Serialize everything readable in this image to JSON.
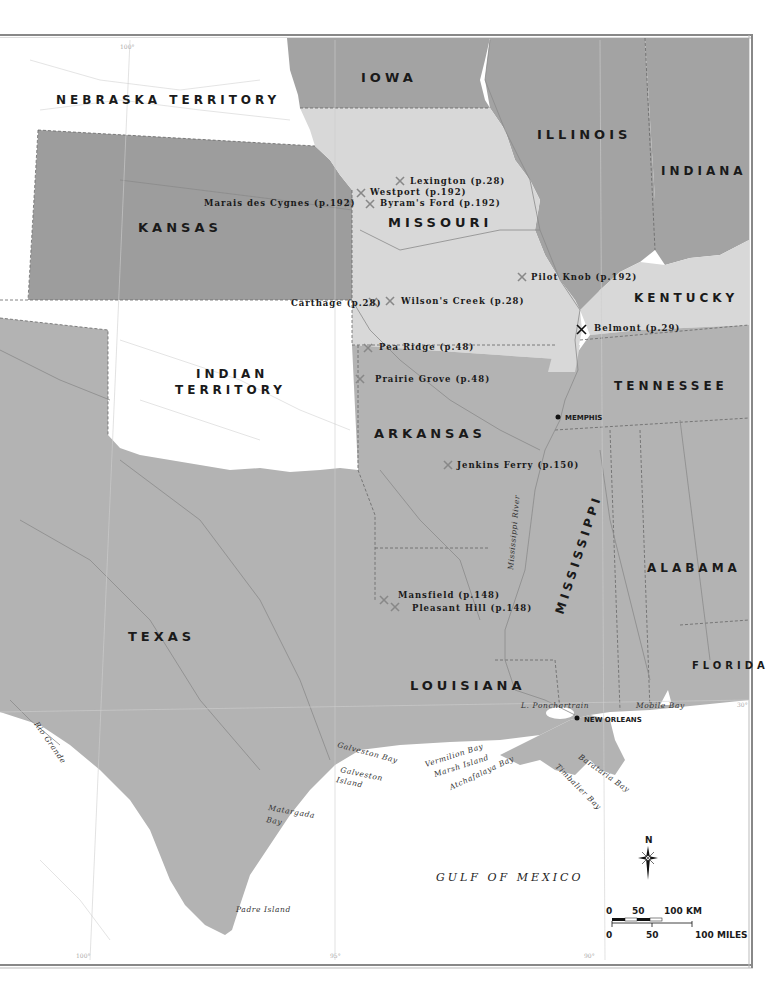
{
  "map": {
    "colors": {
      "background": "#ffffff",
      "union_states": "#a3a3a3",
      "border_states": "#d8d8d8",
      "confederate_states": "#b3b3b3",
      "territories": "#ffffff",
      "kansas": "#9d9d9d",
      "water": "#ffffff",
      "frame": "#888888"
    },
    "regions": {
      "nebraska": "NEBRASKA TERRITORY",
      "iowa": "IOWA",
      "illinois": "ILLINOIS",
      "indiana": "INDIANA",
      "kansas": "KANSAS",
      "missouri": "MISSOURI",
      "kentucky": "KENTUCKY",
      "indian_territory_line1": "INDIAN",
      "indian_territory_line2": "TERRITORY",
      "tennessee": "TENNESSEE",
      "arkansas": "ARKANSAS",
      "mississippi": "MISSISSIPPI",
      "alabama": "ALABAMA",
      "texas": "TEXAS",
      "louisiana": "LOUISIANA",
      "florida": "FLORIDA"
    },
    "battles": [
      {
        "name": "Lexington (p.28)"
      },
      {
        "name": "Westport (p.192)"
      },
      {
        "name": "Marais des Cygnes (p.192)"
      },
      {
        "name": "Byram's Ford (p.192)"
      },
      {
        "name": "Pilot Knob (p.192)"
      },
      {
        "name": "Carthage (p.28)"
      },
      {
        "name": "Wilson's Creek (p.28)"
      },
      {
        "name": "Belmont (p.29)"
      },
      {
        "name": "Pea Ridge (p.48)"
      },
      {
        "name": "Prairie Grove (p.48)"
      },
      {
        "name": "Jenkins Ferry (p.150)"
      },
      {
        "name": "Mansfield (p.148)"
      },
      {
        "name": "Pleasant Hill (p.148)"
      }
    ],
    "cities": {
      "memphis": "MEMPHIS",
      "new_orleans": "NEW ORLEANS"
    },
    "water_features": {
      "mississippi_river": "Mississippi River",
      "rio_grande": "Rio Grande",
      "l_ponchartrain": "L. Ponchartrain",
      "mobile_bay": "Mobile Bay",
      "galveston_bay": "Galveston Bay",
      "galveston_island_1": "Galveston",
      "galveston_island_2": "Island",
      "vermilion_bay": "Vermilion Bay",
      "marsh_island": "Marsh Island",
      "atchafalaya_bay": "Atchafalaya Bay",
      "timbalier_bay": "Timbalier Bay",
      "barataria_bay": "Barataria Bay",
      "matagorda_bay_1": "Matargada",
      "matagorda_bay_2": "Bay",
      "padre_island": "Padre Island",
      "gulf": "GULF OF MEXICO"
    },
    "graticule": {
      "top_100": "100°",
      "bottom_100": "100°",
      "bottom_95": "95°",
      "bottom_90": "90°",
      "lat_30": "30°"
    },
    "compass": {
      "north_label": "N"
    },
    "scale": {
      "km_0": "0",
      "km_50": "50",
      "km_100": "100 KM",
      "mi_0": "0",
      "mi_50": "50",
      "mi_100": "100 MILES"
    }
  }
}
